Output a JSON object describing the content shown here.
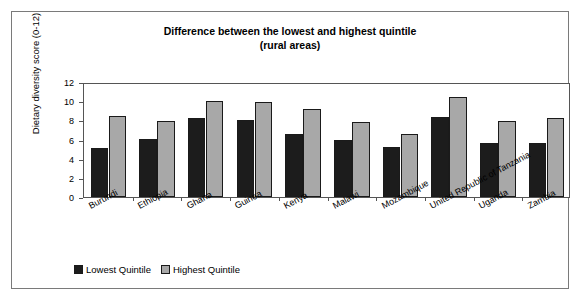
{
  "chart_data": {
    "type": "bar",
    "title": "Difference between the lowest and highest quintile",
    "subtitle": "(rural areas)",
    "xlabel": "",
    "ylabel": "Dietary diversity score (0-12)",
    "ylim": [
      0,
      12
    ],
    "yticks": [
      0,
      2,
      4,
      6,
      8,
      10,
      12
    ],
    "grid": false,
    "legend_position": "bottom-left",
    "categories": [
      "Burundi",
      "Ethiopia",
      "Ghana",
      "Guinea",
      "Kenya",
      "Malawi",
      "Mozambique",
      "United Republic of Tanzania",
      "Uganda",
      "Zambia"
    ],
    "series": [
      {
        "name": "Lowest Quintile",
        "color": "#1c1c1c",
        "values": [
          5.1,
          6.1,
          8.2,
          8.0,
          6.6,
          6.0,
          5.2,
          8.4,
          5.6,
          5.6
        ]
      },
      {
        "name": "Highest Quintile",
        "color": "#a8a8a8",
        "values": [
          8.5,
          7.9,
          10.0,
          9.9,
          9.2,
          7.8,
          6.6,
          10.4,
          7.9,
          8.2
        ]
      }
    ]
  }
}
